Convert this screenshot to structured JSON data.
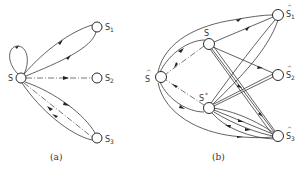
{
  "panels": [
    {
      "caption": "(a)",
      "nodes": [
        {
          "id": "s",
          "label": "S",
          "subscript": "",
          "hat": false
        },
        {
          "id": "s1",
          "label": "S",
          "subscript": "1",
          "hat": false
        },
        {
          "id": "s2",
          "label": "S",
          "subscript": "2",
          "hat": false
        },
        {
          "id": "s3",
          "label": "S",
          "subscript": "3",
          "hat": false
        }
      ],
      "edges": [
        {
          "from": "s",
          "to": "s",
          "style": "solid",
          "type": "self-loop"
        },
        {
          "from": "s",
          "to": "s1",
          "style": "solid"
        },
        {
          "from": "s1",
          "to": "s",
          "style": "solid"
        },
        {
          "from": "s",
          "to": "s2",
          "style": "dash-dot"
        },
        {
          "from": "s",
          "to": "s3",
          "style": "solid"
        },
        {
          "from": "s3",
          "to": "s",
          "style": "solid"
        },
        {
          "from": "s",
          "to": "s3",
          "style": "dash-dot"
        }
      ]
    },
    {
      "caption": "(b)",
      "nodes": [
        {
          "id": "shat",
          "label": "S",
          "subscript": "",
          "hat": true
        },
        {
          "id": "s",
          "label": "S",
          "subscript": "",
          "hat": false
        },
        {
          "id": "sstar",
          "label": "S*",
          "subscript": "",
          "hat": false
        },
        {
          "id": "s1hat",
          "label": "S",
          "subscript": "1",
          "hat": true
        },
        {
          "id": "s2hat",
          "label": "S",
          "subscript": "2",
          "hat": true
        },
        {
          "id": "s3hat",
          "label": "S",
          "subscript": "3",
          "hat": true
        }
      ],
      "edges": [
        {
          "from": "shat",
          "to": "s",
          "style": "solid"
        },
        {
          "from": "s",
          "to": "shat",
          "style": "dash-dot"
        },
        {
          "from": "shat",
          "to": "sstar",
          "style": "solid"
        },
        {
          "from": "sstar",
          "to": "shat",
          "style": "dash-dot"
        },
        {
          "from": "s",
          "to": "s1hat",
          "style": "solid"
        },
        {
          "from": "shat",
          "to": "s1hat",
          "style": "solid"
        },
        {
          "from": "s",
          "to": "s2hat",
          "style": "solid"
        },
        {
          "from": "s",
          "to": "s3hat",
          "style": "solid"
        },
        {
          "from": "sstar",
          "to": "s1hat",
          "style": "solid"
        },
        {
          "from": "sstar",
          "to": "s2hat",
          "style": "solid"
        },
        {
          "from": "sstar",
          "to": "s3hat",
          "style": "solid"
        },
        {
          "from": "s3hat",
          "to": "sstar",
          "style": "solid"
        },
        {
          "from": "shat",
          "to": "s3hat",
          "style": "solid"
        }
      ]
    }
  ],
  "labels": {
    "a_s": "S",
    "a_s1": "S",
    "a_s1_sub": "1",
    "a_s2": "S",
    "a_s2_sub": "2",
    "a_s3": "S",
    "a_s3_sub": "3",
    "a_caption": "(a)",
    "b_shat": "S",
    "b_shat_hat": "^",
    "b_s": "S",
    "b_sstar": "S",
    "b_sstar_sup": "*",
    "b_s1": "S",
    "b_s1_sub": "1",
    "b_s1_hat": "^",
    "b_s2": "S",
    "b_s2_sub": "2",
    "b_s2_hat": "^",
    "b_s3": "S",
    "b_s3_sub": "3",
    "b_s3_hat": "^",
    "b_caption": "(b)"
  }
}
